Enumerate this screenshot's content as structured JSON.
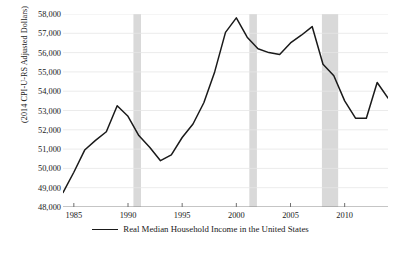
{
  "chart_data": {
    "type": "line",
    "title": "",
    "xlabel": "",
    "ylabel": "(2014 CPI-U-RS Adjusted Dollars)",
    "ylim": [
      48000,
      58000
    ],
    "xlim": [
      1984,
      2014
    ],
    "grid": true,
    "legend_position": "below-axis",
    "y_ticks": [
      "48,000",
      "49,000",
      "50,000",
      "51,000",
      "52,000",
      "53,000",
      "54,000",
      "55,000",
      "56,000",
      "57,000",
      "58,000"
    ],
    "y_tick_values": [
      48000,
      49000,
      50000,
      51000,
      52000,
      53000,
      54000,
      55000,
      56000,
      57000,
      58000
    ],
    "x_ticks": [
      "1985",
      "1990",
      "1995",
      "2000",
      "2005",
      "2010"
    ],
    "x_tick_values": [
      1985,
      1990,
      1995,
      2000,
      2005,
      2010
    ],
    "series": [
      {
        "name": "Real Median Household Income in the United States",
        "color": "#1a1a1a",
        "x": [
          1984,
          1985,
          1986,
          1987,
          1988,
          1989,
          1990,
          1991,
          1992,
          1993,
          1994,
          1995,
          1996,
          1997,
          1998,
          1999,
          2000,
          2001,
          2002,
          2003,
          2004,
          2005,
          2006,
          2007,
          2008,
          2009,
          2010,
          2011,
          2012,
          2013,
          2014
        ],
        "values": [
          48750,
          49800,
          50950,
          51450,
          51900,
          53250,
          52700,
          51700,
          51100,
          50400,
          50700,
          51600,
          52300,
          53400,
          55000,
          57050,
          57800,
          56800,
          56200,
          56000,
          55900,
          56500,
          56900,
          57350,
          55400,
          54800,
          53500,
          52600,
          52600,
          54450,
          53650
        ]
      }
    ],
    "shaded_regions": [
      {
        "label": "recession-1990",
        "start": 1990.5,
        "end": 1991.2,
        "color": "#d9d9d9"
      },
      {
        "label": "recession-2001",
        "start": 2001.2,
        "end": 2001.9,
        "color": "#d9d9d9"
      },
      {
        "label": "recession-2008",
        "start": 2007.9,
        "end": 2009.4,
        "color": "#d9d9d9"
      }
    ]
  },
  "legend": {
    "entry_label": "Real Median Household Income in the United States"
  },
  "caption": {
    "text": ""
  }
}
